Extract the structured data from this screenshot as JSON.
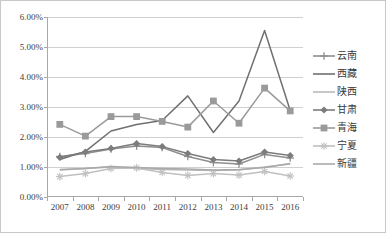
{
  "chart_data": {
    "type": "line",
    "title": "",
    "subtitle": "",
    "xlabel": "",
    "ylabel": "",
    "categories": [
      "2007",
      "2008",
      "2009",
      "2010",
      "2011",
      "2012",
      "2013",
      "2014",
      "2015",
      "2016"
    ],
    "ylim": [
      0,
      6
    ],
    "ytick_labels": [
      "0.00%",
      "1.00%",
      "2.00%",
      "3.00%",
      "4.00%",
      "5.00%",
      "6.00%"
    ],
    "ytick_values": [
      0,
      1,
      2,
      3,
      4,
      5,
      6
    ],
    "yaxis_unit": "%",
    "grid": true,
    "legend_position": "right",
    "series": [
      {
        "name": "云南",
        "color": "#8f8f8f",
        "marker": "plus",
        "values": [
          1.35,
          1.45,
          1.6,
          1.7,
          1.65,
          1.35,
          1.15,
          1.1,
          1.42,
          1.3
        ]
      },
      {
        "name": "西藏",
        "color": "#707070",
        "marker": "none",
        "values": [
          1.25,
          1.52,
          2.2,
          2.42,
          2.55,
          3.37,
          2.15,
          3.2,
          5.55,
          2.88
        ]
      },
      {
        "name": "陕西",
        "color": "#b9b9b9",
        "marker": "none",
        "values": [
          0.9,
          0.95,
          1.0,
          0.95,
          0.92,
          0.9,
          0.88,
          0.9,
          1.0,
          1.1
        ]
      },
      {
        "name": "甘肃",
        "color": "#7c7c7c",
        "marker": "diamond",
        "values": [
          1.32,
          1.5,
          1.62,
          1.78,
          1.68,
          1.45,
          1.25,
          1.2,
          1.5,
          1.38
        ]
      },
      {
        "name": "青海",
        "color": "#9a9a9a",
        "marker": "square",
        "values": [
          2.42,
          2.03,
          2.68,
          2.68,
          2.52,
          2.33,
          3.2,
          2.46,
          3.63,
          2.87
        ]
      },
      {
        "name": "宁夏",
        "color": "#c0c0c0",
        "marker": "star",
        "values": [
          0.68,
          0.78,
          0.95,
          0.97,
          0.82,
          0.72,
          0.78,
          0.73,
          0.85,
          0.7
        ]
      },
      {
        "name": "新疆",
        "color": "#a9a9a9",
        "marker": "none",
        "values": [
          0.92,
          0.95,
          1.02,
          0.98,
          0.95,
          0.93,
          0.9,
          0.92,
          0.98,
          1.12
        ]
      }
    ]
  },
  "legend": {
    "items": [
      {
        "label": "云南"
      },
      {
        "label": "西藏"
      },
      {
        "label": "陕西"
      },
      {
        "label": "甘肃"
      },
      {
        "label": "青海"
      },
      {
        "label": "宁夏"
      },
      {
        "label": "新疆"
      }
    ]
  },
  "style": {
    "plot_background": "#ffffff",
    "frame_border": "#c8c8c8",
    "gridline_color": "#d0d0d0",
    "axis_color": "#a8a8a8",
    "text_color": "#404040"
  }
}
